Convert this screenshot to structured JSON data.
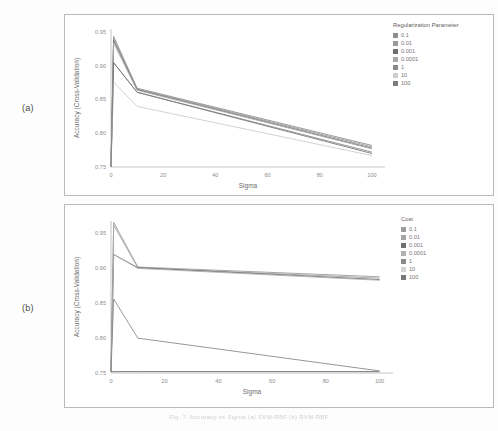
{
  "figure": {
    "panel_a_label": "(a)",
    "panel_b_label": "(b)",
    "caption": "Fig. 7. Accuracy vs Sigma (a) SVM-RBF (b) RVM-RBF"
  },
  "chart_data": [
    {
      "id": "a",
      "type": "line",
      "title": "",
      "xlabel": "Sigma",
      "ylabel": "Accuracy (Cross-Validation)",
      "xlim": [
        0,
        105
      ],
      "ylim": [
        0.75,
        0.955
      ],
      "xticks": [
        0,
        20,
        40,
        60,
        80,
        100
      ],
      "xticklabels": [
        "0",
        "20",
        "40",
        "60",
        "80",
        "100"
      ],
      "yticks": [
        0.75,
        0.8,
        0.85,
        0.9,
        0.95
      ],
      "yticklabels": [
        "0.75",
        "0.80",
        "0.85",
        "0.90",
        "0.95"
      ],
      "grid": false,
      "legend": {
        "title": "Regularization Parameter",
        "position": "right"
      },
      "x": [
        0,
        1,
        10,
        100
      ],
      "series": [
        {
          "name": "0.1",
          "color": "#8e8e8e",
          "values": [
            0.75,
            0.944,
            0.867,
            0.782
          ]
        },
        {
          "name": "0.01",
          "color": "#9a9a9a",
          "values": [
            0.75,
            0.941,
            0.866,
            0.78
          ]
        },
        {
          "name": "0.001",
          "color": "#6f6f6f",
          "values": [
            0.75,
            0.938,
            0.865,
            0.778
          ]
        },
        {
          "name": "0.0001",
          "color": "#a8a8a8",
          "values": [
            0.75,
            0.934,
            0.864,
            0.777
          ]
        },
        {
          "name": "1",
          "color": "#8a8a8a",
          "values": [
            0.75,
            0.905,
            0.861,
            0.772
          ]
        },
        {
          "name": "10",
          "color": "#cdcdcd",
          "values": [
            0.75,
            0.876,
            0.84,
            0.767
          ]
        },
        {
          "name": "100",
          "color": "#7c7c7c",
          "values": [
            0.75,
            0.905,
            0.861,
            0.77
          ]
        }
      ]
    },
    {
      "id": "b",
      "type": "line",
      "title": "",
      "xlabel": "Sigma",
      "ylabel": "Accuracy (Cross-Validation)",
      "xlim": [
        0,
        105
      ],
      "ylim": [
        0.75,
        0.968
      ],
      "xticks": [
        0,
        20,
        40,
        60,
        80,
        100
      ],
      "xticklabels": [
        "0",
        "20",
        "40",
        "60",
        "80",
        "100"
      ],
      "yticks": [
        0.75,
        0.8,
        0.85,
        0.9,
        0.95
      ],
      "yticklabels": [
        "0.75",
        "0.80",
        "0.85",
        "0.90",
        "0.95"
      ],
      "grid": false,
      "legend": {
        "title": "Cost",
        "position": "right"
      },
      "x": [
        0,
        1,
        10,
        100
      ],
      "series": [
        {
          "name": "0.1",
          "color": "#9b9b9b",
          "values": [
            0.752,
            0.966,
            0.902,
            0.888
          ]
        },
        {
          "name": "0.01",
          "color": "#a5a5a5",
          "values": [
            0.752,
            0.962,
            0.901,
            0.886
          ]
        },
        {
          "name": "0.001",
          "color": "#707070",
          "values": [
            0.752,
            0.92,
            0.901,
            0.884
          ]
        },
        {
          "name": "0.0001",
          "color": "#b0b0b0",
          "values": [
            0.752,
            0.92,
            0.9,
            0.883
          ]
        },
        {
          "name": "1",
          "color": "#8b8b8b",
          "values": [
            0.752,
            0.856,
            0.8,
            0.753
          ]
        },
        {
          "name": "10",
          "color": "#d2d2d2",
          "values": [
            0.752,
            0.752,
            0.752,
            0.752
          ]
        },
        {
          "name": "100",
          "color": "#787878",
          "values": [
            0.752,
            0.752,
            0.752,
            0.752
          ]
        }
      ]
    }
  ]
}
